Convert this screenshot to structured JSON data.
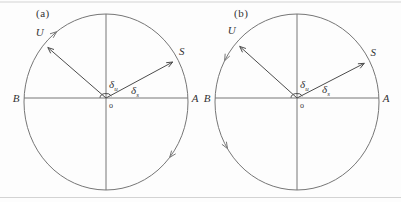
{
  "colors": {
    "background": "#fdfdfd",
    "line": "#767676",
    "vector": "#4c4c4c",
    "text": "#333333",
    "border": "#d3d3d3"
  },
  "border_lines": {
    "top_y": 2,
    "bottom_y": 197.5
  },
  "panels": [
    {
      "id": "a",
      "label": "(a)",
      "rotation": "clockwise",
      "center": {
        "x": 106,
        "y": 102
      },
      "rx": 82,
      "ry": 88,
      "axis_y": 98,
      "origin_label": "o",
      "left_label": "B",
      "right_label": "A",
      "vectors": [
        {
          "label": "U",
          "angle_deg": 139,
          "length_frac": 0.94,
          "label_dx": -8,
          "label_dy": -11
        },
        {
          "label": "S",
          "angle_deg": 29,
          "length_frac": 0.93,
          "label_dx": 9,
          "label_dy": -7
        }
      ],
      "angle_labels": [
        {
          "base": "δ",
          "sub": "u",
          "x": 109,
          "y": 88
        },
        {
          "base": "δ",
          "sub": "s",
          "x": 131,
          "y": 94
        }
      ],
      "angle_arc": {
        "rx": 6,
        "ry": 4.5,
        "from_deg": 178,
        "to_deg": 26
      },
      "rotation_arrows_deg": [
        127,
        -39
      ]
    },
    {
      "id": "b",
      "label": "(b)",
      "rotation": "counterclockwise",
      "center": {
        "x": 297,
        "y": 102
      },
      "rx": 82,
      "ry": 88,
      "axis_y": 98,
      "origin_label": "o",
      "left_label": "B",
      "right_label": "A",
      "vectors": [
        {
          "label": "U",
          "angle_deg": 138,
          "length_frac": 0.94,
          "label_dx": -8,
          "label_dy": -12
        },
        {
          "label": "S",
          "angle_deg": 28,
          "length_frac": 0.93,
          "label_dx": 9,
          "label_dy": -7
        }
      ],
      "angle_labels": [
        {
          "base": "δ",
          "sub": "u",
          "x": 300,
          "y": 88
        },
        {
          "base": "δ",
          "sub": "s",
          "x": 322,
          "y": 93
        }
      ],
      "angle_arc": {
        "rx": 6,
        "ry": 4.5,
        "from_deg": 178,
        "to_deg": 26
      },
      "rotation_arrows_deg": [
        152,
        212
      ]
    }
  ]
}
